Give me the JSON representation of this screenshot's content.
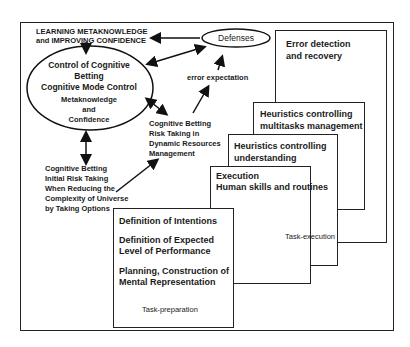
{
  "diagram": {
    "top_label": [
      "LEARNING METAKNOWLEDGE",
      "and IMPROVING CONFIDENCE"
    ],
    "ellipse": {
      "title": [
        "Control of Cognitive",
        "Betting",
        "Cognitive Mode Control"
      ],
      "sub": [
        "Metaknowledge",
        "and",
        "Confidence"
      ]
    },
    "defenses": "Defenses",
    "error_expectation": "error expectation",
    "dynamic_betting": [
      "Cognitive Betting",
      "Risk Taking in",
      "Dynamic Resources",
      "Management"
    ],
    "initial_betting": [
      "Cognitive Betting",
      "Initial Risk Taking",
      "When Reducing the",
      "Complexity of Universe",
      "by Taking Options"
    ],
    "boxes": {
      "error_detection": [
        "Error detection",
        "and recovery"
      ],
      "multitasks": [
        "Heuristics controlling",
        "multitasks management"
      ],
      "understanding": [
        "Heuristics controlling",
        "understanding"
      ],
      "execution": [
        "Execution",
        "Human skills and routines"
      ],
      "task_execution": "Task-execution",
      "preparation": {
        "intentions": "Definition of Intentions",
        "performance": [
          "Definition of Expected",
          "Level of Performance"
        ],
        "planning": [
          "Planning, Construction of",
          "Mental Representation"
        ],
        "label": "Task-preparation"
      }
    }
  }
}
